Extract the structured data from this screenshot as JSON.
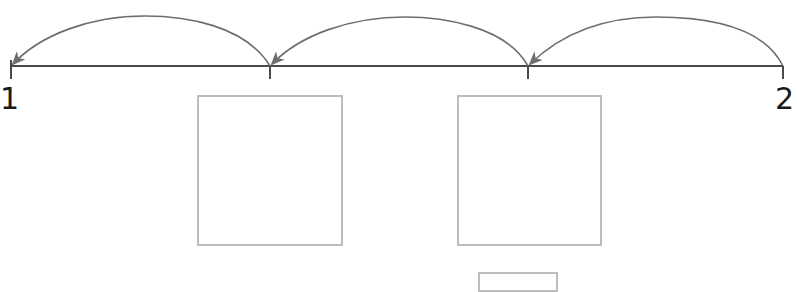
{
  "number_line": {
    "start_label": "1",
    "end_label": "2",
    "ticks_x": [
      11,
      270,
      528,
      783
    ],
    "line_y": 66,
    "line_color": "#4a4a4a",
    "arrow_color": "#6e6e6e",
    "jumps": [
      {
        "from": 3,
        "to": 2,
        "direction": "backward"
      },
      {
        "from": 2,
        "to": 1,
        "direction": "backward"
      },
      {
        "from": 1,
        "to": 0,
        "direction": "backward"
      }
    ]
  },
  "answer_boxes": [
    {
      "name": "box-tick-1",
      "left": 197,
      "top": 95,
      "width": 146,
      "height": 151,
      "value": ""
    },
    {
      "name": "box-tick-2",
      "left": 457,
      "top": 95,
      "width": 145,
      "height": 151,
      "value": ""
    },
    {
      "name": "box-extra",
      "left": 478,
      "top": 272,
      "width": 80,
      "height": 20,
      "value": ""
    }
  ],
  "box_border_color": "#bdbdbd"
}
